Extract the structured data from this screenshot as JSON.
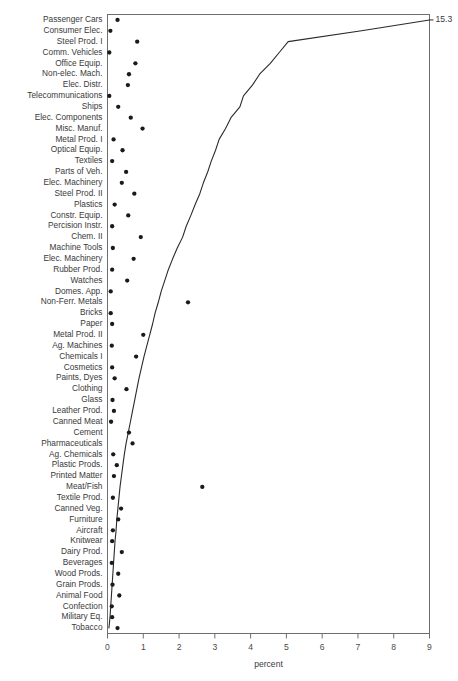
{
  "chart_data": {
    "type": "scatter",
    "title": "",
    "xlabel": "percent",
    "ylabel": "",
    "xlim": [
      0,
      9
    ],
    "ylim": [
      0,
      60
    ],
    "grid": false,
    "legend": null,
    "orientation": "horizontal",
    "xticks": [
      0,
      1,
      2,
      3,
      4,
      5,
      6,
      7,
      8,
      9
    ],
    "xticklabels": [
      "0",
      "1",
      "2",
      "3",
      "4",
      "5",
      "6",
      "7",
      "8",
      "9"
    ],
    "annotations": [
      {
        "text": "15.3",
        "x": 9.0,
        "category": "Passenger Cars",
        "note": "cumulative total at top of line"
      }
    ],
    "categories": [
      "Passenger Cars",
      "Consumer Elec.",
      "Steel Prod. I",
      "Comm. Vehicles",
      "Office Equip.",
      "Non-elec. Mach.",
      "Elec. Distr.",
      "Telecommunications",
      "Ships",
      "Elec. Components",
      "Misc. Manuf.",
      "Metal Prod. I",
      "Optical Equip.",
      "Textiles",
      "Parts of Veh.",
      "Elec. Machinery",
      "Steel Prod. II",
      "Plastics",
      "Constr. Equip.",
      "Percision Instr.",
      "Chem. II",
      "Machine Tools",
      "Elec. Machinery",
      "Rubber Prod.",
      "Watches",
      "Domes. App.",
      "Non-Ferr. Metals",
      "Bricks",
      "Paper",
      "Metal Prod. II",
      "Ag. Machines",
      "Chemicals I",
      "Cosmetics",
      "Paints, Dyes",
      "Clothing",
      "Glass",
      "Leather Prod.",
      "Canned Meat",
      "Cement",
      "Pharmaceuticals",
      "Ag. Chemicals",
      "Plastic Prods.",
      "Printed Matter",
      "Meat/Fish",
      "Textile Prod.",
      "Canned Veg.",
      "Furniture",
      "Aircraft",
      "Knitwear",
      "Dairy Prod.",
      "Beverages",
      "Wood Prods.",
      "Grain Prods.",
      "Animal Food",
      "Confection",
      "Military Eq.",
      "Tobacco"
    ],
    "series": [
      {
        "name": "percent",
        "type": "scatter",
        "values": [
          0.28,
          0.08,
          0.83,
          0.05,
          0.78,
          0.6,
          0.57,
          0.05,
          0.3,
          0.65,
          0.98,
          0.17,
          0.42,
          0.13,
          0.52,
          0.4,
          0.75,
          0.2,
          0.58,
          0.13,
          0.93,
          0.15,
          0.73,
          0.13,
          0.55,
          0.09,
          2.25,
          0.09,
          0.13,
          1.0,
          0.12,
          0.8,
          0.13,
          0.2,
          0.53,
          0.14,
          0.18,
          0.1,
          0.6,
          0.7,
          0.16,
          0.26,
          0.18,
          2.65,
          0.15,
          0.38,
          0.3,
          0.15,
          0.13,
          0.4,
          0.12,
          0.3,
          0.14,
          0.33,
          0.12,
          0.13,
          0.28
        ]
      },
      {
        "name": "cumulative percent",
        "type": "line",
        "values": [
          9.0,
          7.1,
          5.05,
          4.8,
          4.55,
          4.25,
          4.05,
          3.8,
          3.7,
          3.45,
          3.3,
          3.12,
          3.02,
          2.9,
          2.8,
          2.68,
          2.58,
          2.45,
          2.33,
          2.2,
          2.1,
          1.95,
          1.82,
          1.7,
          1.6,
          1.5,
          1.42,
          1.33,
          1.26,
          1.18,
          1.1,
          1.02,
          0.95,
          0.88,
          0.82,
          0.76,
          0.7,
          0.64,
          0.58,
          0.52,
          0.47,
          0.43,
          0.39,
          0.35,
          0.32,
          0.29,
          0.26,
          0.24,
          0.21,
          0.19,
          0.17,
          0.15,
          0.13,
          0.11,
          0.09,
          0.07,
          0.04
        ]
      }
    ]
  }
}
